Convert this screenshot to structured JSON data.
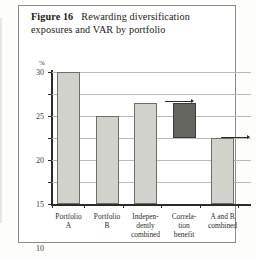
{
  "figure": {
    "label": "Figure 16",
    "caption": "Rewarding diversification exposures and VAR by portfolio"
  },
  "chart_data": {
    "type": "bar",
    "title": "Rewarding diversification exposures and VAR by portfolio",
    "xlabel": "",
    "ylabel": "%",
    "ylim": [
      0,
      30
    ],
    "yticks": [
      0,
      5,
      10,
      15,
      20,
      25,
      30
    ],
    "grid": true,
    "legend": false,
    "categories": [
      "Portfolio\nA",
      "Portfolio\nB",
      "Indepen-\ndently\ncombined",
      "Correla-\ntion\nbenefit",
      "A and B\ncombined"
    ],
    "values": [
      30,
      20,
      23,
      8,
      15
    ],
    "bars": [
      {
        "category": "Portfolio A",
        "base": 0,
        "top": 30,
        "value": 30,
        "style": "light"
      },
      {
        "category": "Portfolio B",
        "base": 0,
        "top": 20,
        "value": 20,
        "style": "light"
      },
      {
        "category": "Independently combined",
        "base": 0,
        "top": 23,
        "value": 23,
        "style": "light"
      },
      {
        "category": "Correlation benefit",
        "base": 15,
        "top": 23,
        "value": 8,
        "style": "dark"
      },
      {
        "category": "A and B combined",
        "base": 0,
        "top": 15,
        "value": 15,
        "style": "light"
      }
    ],
    "annotations": [
      {
        "name": "connector-top",
        "from_value": 23,
        "note": "arrow from Independently combined top to Correlation benefit top"
      },
      {
        "name": "connector-bottom",
        "from_value": 15,
        "note": "arrow from Correlation benefit base to A and B combined top"
      }
    ],
    "colors": {
      "light_bar": "#d2d2cd",
      "dark_bar": "#656560",
      "axis": "#2b2b29",
      "gridline": "#b9b9b4"
    }
  },
  "axis_labels": {
    "percent_symbol": "%",
    "y": [
      "30",
      "25",
      "20",
      "15",
      "10",
      "5",
      "0"
    ]
  }
}
